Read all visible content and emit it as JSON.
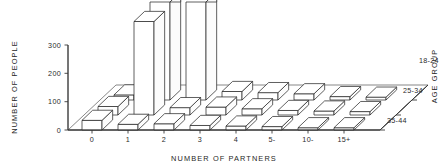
{
  "chart_data": {
    "type": "bar",
    "render": "3d-bar",
    "title": "",
    "xlabel": "NUMBER OF PARTNERS",
    "ylabel": "NUMBER OF PEOPLE",
    "zlabel": "AGE GROUP",
    "categories": [
      "0",
      "1",
      "2",
      "3",
      "4",
      "5-",
      "10-",
      "15+"
    ],
    "row_labels": [
      "18-24",
      "25-34",
      "35-44"
    ],
    "yticks": [
      0,
      100,
      200,
      300
    ],
    "ytick_labels": [
      "0",
      "100",
      "200",
      "300"
    ],
    "ylim": [
      0,
      300
    ],
    "grid": false,
    "legend": "none",
    "note_clipped": "Bars for 18-24 at partners 1 and 2 and 25-34 at partner 1 exceed the 300 axis maximum and are drawn clipped at the top of the frame.",
    "series": [
      {
        "name": "18-24",
        "values": [
          18,
          420,
          360,
          30,
          26,
          22,
          12,
          10
        ]
      },
      {
        "name": "25-34",
        "values": [
          30,
          330,
          26,
          28,
          22,
          16,
          14,
          12
        ]
      },
      {
        "name": "35-44",
        "values": [
          34,
          20,
          22,
          16,
          14,
          12,
          8,
          8
        ]
      }
    ]
  },
  "axes": {
    "y_title": "NUMBER OF PEOPLE",
    "x_title": "NUMBER OF PARTNERS",
    "z_title": "AGE GROUP",
    "y_tick_0": "0",
    "y_tick_1": "100",
    "y_tick_2": "200",
    "y_tick_3": "300",
    "x_tick_0": "0",
    "x_tick_1": "1",
    "x_tick_2": "2",
    "x_tick_3": "3",
    "x_tick_4": "4",
    "x_tick_5": "5-",
    "x_tick_6": "10-",
    "x_tick_7": "15+",
    "z_tick_0": "18-24",
    "z_tick_1": "25-34",
    "z_tick_2": "35-44"
  },
  "colors": {
    "ink": "#2b2b2b",
    "bar_fill": "#ffffff",
    "background": "#ffffff"
  }
}
